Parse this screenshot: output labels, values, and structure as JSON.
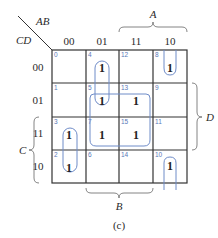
{
  "kmap": {
    "row_var": "CD",
    "col_var": "AB",
    "col_labels": [
      "00",
      "01",
      "11",
      "10"
    ],
    "row_labels": [
      "00",
      "01",
      "11",
      "10"
    ],
    "cells": [
      [
        {
          "index": "0",
          "value": ""
        },
        {
          "index": "4",
          "value": "1"
        },
        {
          "index": "12",
          "value": ""
        },
        {
          "index": "8",
          "value": "1"
        }
      ],
      [
        {
          "index": "1",
          "value": ""
        },
        {
          "index": "5",
          "value": "1"
        },
        {
          "index": "13",
          "value": "1"
        },
        {
          "index": "9",
          "value": ""
        }
      ],
      [
        {
          "index": "3",
          "value": "1"
        },
        {
          "index": "7",
          "value": "1"
        },
        {
          "index": "15",
          "value": "1"
        },
        {
          "index": "11",
          "value": ""
        }
      ],
      [
        {
          "index": "2",
          "value": "1"
        },
        {
          "index": "6",
          "value": ""
        },
        {
          "index": "14",
          "value": ""
        },
        {
          "index": "10",
          "value": "1"
        }
      ]
    ],
    "braces": {
      "A": "A",
      "B": "B",
      "C": "C",
      "D": "D"
    },
    "caption": "(c)",
    "group_color": "#6f8cc8",
    "index_color": "#5a78b8"
  }
}
